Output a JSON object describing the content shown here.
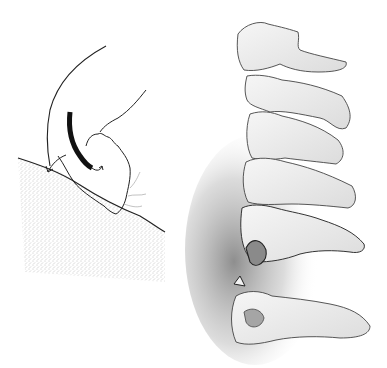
{
  "figure": {
    "panels": [
      {
        "name": "impact-diagram",
        "elements": [
          "head-outline",
          "flexion-arrow",
          "rotation-arrow",
          "ground-slope"
        ]
      },
      {
        "name": "cervical-spine",
        "elements": [
          "vertebra-c2",
          "vertebra-c3",
          "vertebra-c4",
          "vertebra-c5",
          "vertebra-c6",
          "vertebra-c7",
          "fracture-fragment"
        ]
      }
    ],
    "colors": {
      "background": "#ffffff",
      "line": "#2a2a2a",
      "bone_fill": "#efefef",
      "shadow": "#8a8a8a",
      "stipple": "#9a9a9a"
    }
  }
}
